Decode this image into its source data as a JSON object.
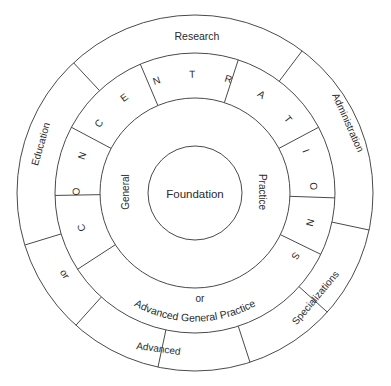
{
  "diagram": {
    "center": {
      "x": 195,
      "y": 193
    },
    "radii": {
      "outer": 178,
      "ring2": 140,
      "ring3": 95,
      "core": 47
    },
    "stroke_color": "#4a4a4a",
    "text_color": "#2a2a2a",
    "core": {
      "label": "Foundation"
    },
    "general_ring": {
      "left_label": "General",
      "right_label": "Practice",
      "bottom_or": "or",
      "bottom_label": "Advanced General Practice"
    },
    "concentrations_ring": {
      "letters": [
        "C",
        "O",
        "N",
        "C",
        "E",
        "N",
        "T",
        "R",
        "A",
        "T",
        "I",
        "O",
        "N",
        "S"
      ]
    },
    "outer_ring": {
      "labels": {
        "research": "Research",
        "administration": "Administration",
        "specializations": "Specializations",
        "advanced": "Advanced",
        "or": "or",
        "education": "Education"
      }
    },
    "outer_dividers_deg": [
      227,
      307,
      12,
      42,
      72,
      102,
      132,
      163
    ],
    "ring2_dividers_deg": [
      179,
      208,
      247,
      288,
      332,
      2,
      26,
      147
    ]
  }
}
